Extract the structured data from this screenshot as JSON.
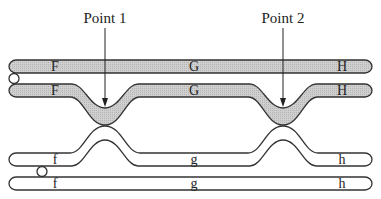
{
  "diagram": {
    "points": [
      {
        "label": "Point 1",
        "x": 105
      },
      {
        "label": "Point 2",
        "x": 283
      }
    ],
    "chromatids": [
      {
        "id": "chromatid-1",
        "shaded": true,
        "genes": [
          "F",
          "G",
          "H"
        ]
      },
      {
        "id": "chromatid-2",
        "shaded": true,
        "genes": [
          "F",
          "G",
          "H"
        ]
      },
      {
        "id": "chromatid-3",
        "shaded": false,
        "genes": [
          "f",
          "g",
          "h"
        ]
      },
      {
        "id": "chromatid-4",
        "shaded": false,
        "genes": [
          "f",
          "g",
          "h"
        ]
      }
    ],
    "colors": {
      "shaded_fill": "#c8c8c8",
      "unshaded_fill": "#ffffff",
      "outline": "#333333"
    }
  }
}
